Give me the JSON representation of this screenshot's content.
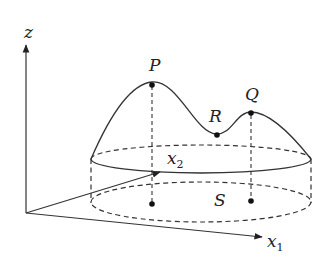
{
  "diagram": {
    "axes": {
      "z": {
        "label": "z"
      },
      "x1": {
        "label": "x",
        "subscript": "1"
      },
      "x2": {
        "label": "x",
        "subscript": "2"
      }
    },
    "points": {
      "P": {
        "label": "P"
      },
      "Q": {
        "label": "Q"
      },
      "R": {
        "label": "R"
      }
    },
    "region": {
      "label": "S"
    },
    "colors": {
      "stroke": "#222222",
      "background": "#ffffff"
    }
  }
}
